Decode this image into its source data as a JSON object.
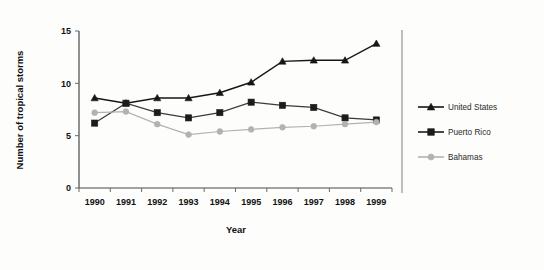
{
  "chart_data": {
    "type": "line",
    "title": "",
    "xlabel": "Year",
    "ylabel": "Number of tropical storms",
    "categories": [
      "1990",
      "1991",
      "1992",
      "1993",
      "1994",
      "1995",
      "1996",
      "1997",
      "1998",
      "1999"
    ],
    "x": [
      1990,
      1991,
      1992,
      1993,
      1994,
      1995,
      1996,
      1997,
      1998,
      1999
    ],
    "ylim": [
      0,
      15
    ],
    "yticks": [
      0,
      5,
      10,
      15
    ],
    "ytick_labels": [
      "0",
      "5",
      "10",
      "15"
    ],
    "grid": false,
    "legend_position": "right",
    "series": [
      {
        "name": "United States",
        "marker": "triangle",
        "color": "#161616",
        "values": [
          8.6,
          8.1,
          8.6,
          8.6,
          9.1,
          10.1,
          12.1,
          12.2,
          12.2,
          13.8
        ]
      },
      {
        "name": "Puerto Rico",
        "marker": "square",
        "color": "#1c1c1c",
        "values": [
          6.2,
          8.1,
          7.2,
          6.7,
          7.2,
          8.2,
          7.9,
          7.7,
          6.7,
          6.5
        ]
      },
      {
        "name": "Bahamas",
        "marker": "circle",
        "color": "#b2b2b2",
        "values": [
          7.2,
          7.3,
          6.1,
          5.1,
          5.4,
          5.6,
          5.8,
          5.9,
          6.1,
          6.3
        ]
      }
    ]
  },
  "axes": {
    "y_axis_title": "Number of tropical storms",
    "x_axis_title": "Year"
  },
  "legend": {
    "items": [
      {
        "label": "United States",
        "marker": "triangle-marker-icon",
        "color": "#161616"
      },
      {
        "label": "Puerto Rico",
        "marker": "square-marker-icon",
        "color": "#1c1c1c"
      },
      {
        "label": "Bahamas",
        "marker": "circle-marker-icon",
        "color": "#b2b2b2"
      }
    ]
  }
}
